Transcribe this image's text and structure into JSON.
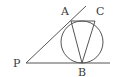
{
  "diagram": {
    "type": "geometry",
    "colors": {
      "stroke": "#555555",
      "text": "#3a3a3a",
      "background": "#ffffff"
    },
    "points": {
      "P": {
        "label": "P",
        "x": 26,
        "y": 63
      },
      "A": {
        "label": "A",
        "x": 71,
        "y": 21
      },
      "B": {
        "label": "B",
        "x": 82,
        "y": 63
      },
      "C": {
        "label": "C",
        "x": 95,
        "y": 21
      }
    },
    "circle": {
      "cx": 82,
      "cy": 42,
      "r": 21
    },
    "segments": [
      {
        "from": "P",
        "to": "end",
        "x2": 110,
        "y2": 63,
        "name": "tangent-line-pb"
      },
      {
        "from": "P",
        "to": "ext",
        "x2": 86,
        "y2": 6,
        "name": "tangent-line-pa"
      },
      {
        "from": "A",
        "to": "C",
        "name": "chord-ac"
      },
      {
        "from": "A",
        "to": "B",
        "name": "chord-ab"
      },
      {
        "from": "C",
        "to": "B",
        "name": "chord-cb"
      }
    ]
  }
}
